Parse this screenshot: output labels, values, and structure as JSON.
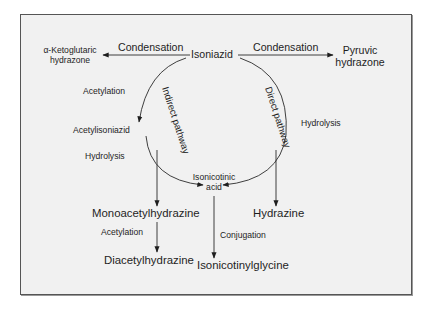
{
  "diagram": {
    "nodes": {
      "isoniazid": "Isoniazid",
      "ketoglutaric_line1": "α-Ketoglutaric",
      "ketoglutaric_line2": "hydrazone",
      "pyruvic_line1": "Pyruvic",
      "pyruvic_line2": "hydrazone",
      "acetylisoniazid": "Acetylisoniazid",
      "isonicotinic_line1": "Isonicotinic",
      "isonicotinic_line2": "acid",
      "monoacetylhydrazine": "Monoacetylhydrazine",
      "diacetylhydrazine": "Diacetylhydrazine",
      "hydrazine": "Hydrazine",
      "isonicotinylglycine": "Isonicotinylglycine"
    },
    "edge_labels": {
      "condensation_left": "Condensation",
      "condensation_right": "Condensation",
      "acetylation_1": "Acetylation",
      "hydrolysis_left": "Hydrolysis",
      "hydrolysis_right": "Hydrolysis",
      "acetylation_2": "Acetylation",
      "conjugation": "Conjugation"
    },
    "pathway_labels": {
      "indirect": "Indirect pathway",
      "direct": "Direct pathway"
    },
    "edges": [
      {
        "from": "Isoniazid",
        "to": "α-Ketoglutaric hydrazone",
        "label": "Condensation"
      },
      {
        "from": "Isoniazid",
        "to": "Pyruvic hydrazone",
        "label": "Condensation"
      },
      {
        "from": "Isoniazid",
        "to": "Acetylisoniazid",
        "label": "Acetylation",
        "pathway": "Indirect pathway"
      },
      {
        "from": "Acetylisoniazid",
        "to": "Isonicotinic acid",
        "label": "Hydrolysis",
        "pathway": "Indirect pathway"
      },
      {
        "from": "Acetylisoniazid",
        "to": "Monoacetylhydrazine",
        "label": "Hydrolysis"
      },
      {
        "from": "Monoacetylhydrazine",
        "to": "Diacetylhydrazine",
        "label": "Acetylation"
      },
      {
        "from": "Isoniazid",
        "to": "Isonicotinic acid",
        "label": "Hydrolysis",
        "pathway": "Direct pathway"
      },
      {
        "from": "Isoniazid",
        "to": "Hydrazine",
        "label": "Hydrolysis",
        "pathway": "Direct pathway"
      },
      {
        "from": "Isonicotinic acid",
        "to": "Isonicotinylglycine",
        "label": "Conjugation"
      }
    ],
    "colors": {
      "panel_bg": "#f1f1f1",
      "border": "#555555",
      "line": "#2a2a2a",
      "text": "#1e1e1e"
    }
  }
}
